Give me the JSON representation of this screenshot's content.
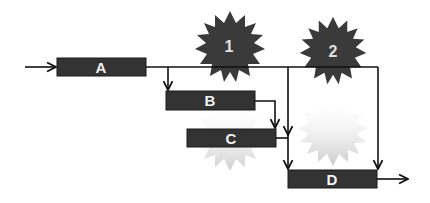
{
  "diagram": {
    "tasks": [
      {
        "id": "A",
        "label": "A"
      },
      {
        "id": "B",
        "label": "B"
      },
      {
        "id": "C",
        "label": "C"
      },
      {
        "id": "D",
        "label": "D"
      }
    ],
    "milestones": [
      {
        "id": "1",
        "label": "1"
      },
      {
        "id": "2",
        "label": "2"
      }
    ],
    "colors": {
      "box_fill": "#333333",
      "box_stroke": "#1a1a1a",
      "star_fill": "#3a3a3a",
      "line": "#111111",
      "label": "#f2f2f2"
    }
  }
}
